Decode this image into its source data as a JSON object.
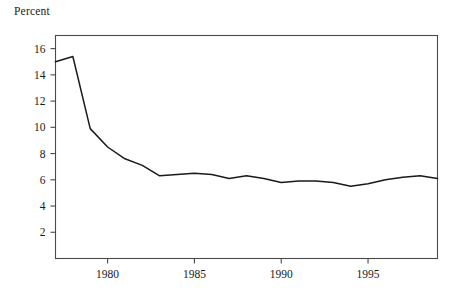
{
  "figure": {
    "axis_title": "Percent",
    "line_color": "#1a1a1a",
    "frame_color": "#4a4a4a",
    "background": "#ffffff"
  },
  "chart_data": {
    "type": "line",
    "title": "",
    "subtitle": "",
    "xlabel": "",
    "ylabel": "Percent",
    "axis_title_position": "top-left",
    "grid": false,
    "legend": null,
    "xlim": [
      1977,
      1999
    ],
    "ylim": [
      0,
      17
    ],
    "xticks": [
      1980,
      1985,
      1990,
      1995
    ],
    "xtick_labels": [
      "1980",
      "1985",
      "1990",
      "1995"
    ],
    "yticks": [
      2,
      4,
      6,
      8,
      10,
      12,
      14,
      16
    ],
    "ytick_labels": [
      "2",
      "4",
      "6",
      "8",
      "10",
      "12",
      "14",
      "16"
    ],
    "tick_direction": "out",
    "x": [
      1977,
      1978,
      1979,
      1980,
      1981,
      1982,
      1983,
      1984,
      1985,
      1986,
      1987,
      1988,
      1989,
      1990,
      1991,
      1992,
      1993,
      1994,
      1995,
      1996,
      1997,
      1998,
      1999
    ],
    "series": [
      {
        "name": "Percent",
        "values": [
          15.0,
          15.4,
          9.9,
          8.5,
          7.6,
          7.1,
          6.3,
          6.4,
          6.5,
          6.4,
          6.1,
          6.3,
          6.1,
          5.8,
          5.9,
          5.9,
          5.8,
          5.5,
          5.7,
          6.0,
          6.2,
          6.3,
          6.1
        ]
      }
    ]
  }
}
